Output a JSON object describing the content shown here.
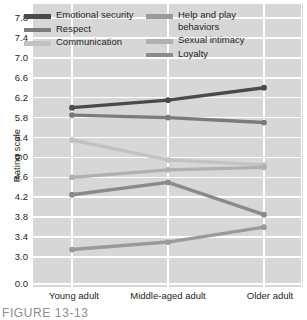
{
  "chart_data": {
    "type": "line",
    "title": "",
    "xlabel": "",
    "ylabel": "Rating scale",
    "categories": [
      "Young adult",
      "Middle-aged adult",
      "Older adult"
    ],
    "ylim": [
      3.0,
      7.8
    ],
    "yticks": [
      "7.8",
      "7.4",
      "7.0",
      "6.6",
      "6.2",
      "5.8",
      "5.4",
      "5.0",
      "4.6",
      "4.2",
      "3.8",
      "3.4",
      "3.0",
      "0.0"
    ],
    "ytick_values": [
      7.8,
      7.4,
      7.0,
      6.6,
      6.2,
      5.8,
      5.4,
      5.0,
      4.6,
      4.2,
      3.8,
      3.4,
      3.0,
      0.0
    ],
    "axis_break": true,
    "grid": "both",
    "legend_position": "top-inside",
    "plot_background": "#d7d7d7",
    "grid_color": "#ffffff",
    "series": [
      {
        "name": "Emotional security",
        "values": [
          6.0,
          6.15,
          6.4
        ],
        "color": "#4a4a4a"
      },
      {
        "name": "Respect",
        "values": [
          5.85,
          5.8,
          5.7
        ],
        "color": "#7b7b7b"
      },
      {
        "name": "Communication",
        "values": [
          5.35,
          4.95,
          4.85
        ],
        "color": "#c2c2c2"
      },
      {
        "name": "Help and play behaviors",
        "values": [
          3.15,
          3.3,
          3.6
        ],
        "color": "#9a9a9a"
      },
      {
        "name": "Sexual intimacy",
        "values": [
          4.6,
          4.75,
          4.8
        ],
        "color": "#b0b0b0"
      },
      {
        "name": "Loyalty",
        "values": [
          4.25,
          4.5,
          3.85
        ],
        "color": "#8a8a8a"
      }
    ]
  },
  "legend": {
    "left_column": [
      {
        "label": "Emotional security",
        "color": "#4a4a4a"
      },
      {
        "label": "Respect",
        "color": "#7b7b7b"
      },
      {
        "label": "Communication",
        "color": "#c2c2c2"
      }
    ],
    "right_column": [
      {
        "label": "Help and play behaviors",
        "color": "#9a9a9a"
      },
      {
        "label": "Sexual intimacy",
        "color": "#b0b0b0"
      },
      {
        "label": "Loyalty",
        "color": "#8a8a8a"
      }
    ]
  },
  "caption": {
    "text": "FIGURE 13-13"
  }
}
